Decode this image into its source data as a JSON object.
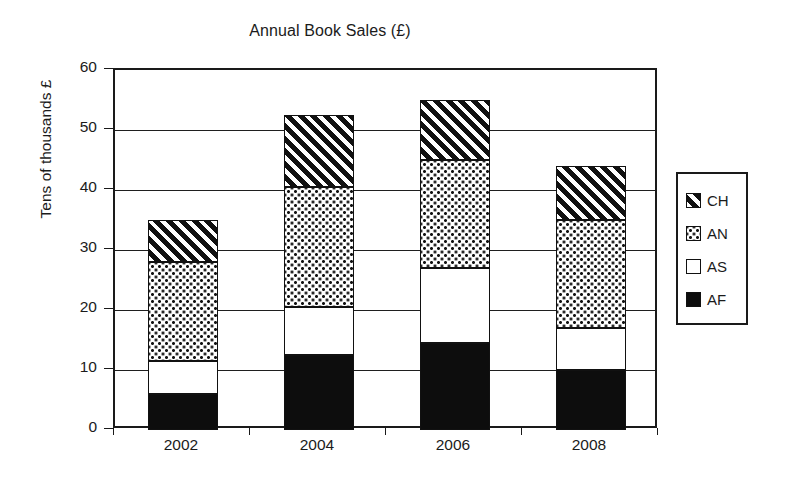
{
  "chart_data": {
    "type": "bar",
    "stacked": true,
    "title": "Annual Book Sales (£)",
    "xlabel": "",
    "ylabel": "Tens of thousands £",
    "categories": [
      "2002",
      "2004",
      "2006",
      "2008"
    ],
    "ylim": [
      0,
      60
    ],
    "yticks": [
      0,
      10,
      20,
      30,
      40,
      50,
      60
    ],
    "ytick_labels": [
      "0",
      "10",
      "20",
      "30",
      "40",
      "50",
      "60"
    ],
    "grid": "horizontal",
    "legend_position": "right-outside",
    "series": [
      {
        "name": "AF",
        "pattern": "solid-black",
        "values": [
          6.0,
          12.5,
          14.5,
          10.0
        ]
      },
      {
        "name": "AS",
        "pattern": "white",
        "values": [
          5.5,
          8.0,
          12.5,
          7.0
        ]
      },
      {
        "name": "AN",
        "pattern": "dotted",
        "values": [
          16.5,
          20.0,
          18.0,
          18.0
        ]
      },
      {
        "name": "CH",
        "pattern": "diagonal-hatch",
        "values": [
          7.0,
          12.0,
          10.0,
          9.0
        ]
      }
    ],
    "cumulative_tops": {
      "AF": [
        6.0,
        12.5,
        14.5,
        10.0
      ],
      "AS": [
        11.5,
        20.5,
        27.0,
        17.0
      ],
      "AN": [
        28.0,
        40.5,
        45.0,
        35.0
      ],
      "CH": [
        35.0,
        52.5,
        55.0,
        44.0
      ]
    },
    "totals": [
      35.0,
      52.5,
      55.0,
      44.0
    ]
  },
  "legend": {
    "entries": [
      {
        "label": "CH",
        "pattern": "diagonal-hatch"
      },
      {
        "label": "AN",
        "pattern": "dotted"
      },
      {
        "label": "AS",
        "pattern": "white"
      },
      {
        "label": "AF",
        "pattern": "solid-black"
      }
    ]
  },
  "colors": {
    "ink": "#1a1a1a",
    "fill_dark": "#0d0d0d",
    "background": "#ffffff"
  }
}
